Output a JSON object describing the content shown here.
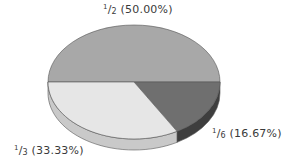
{
  "chart_data": {
    "type": "pie",
    "style": "3d",
    "title": "",
    "categories": [
      "1/2",
      "1/6",
      "1/3"
    ],
    "values": [
      50.0,
      16.67,
      33.33
    ],
    "labels": [
      "1/2 (50.00%)",
      "1/6 (16.67%)",
      "1/3 (33.33%)"
    ],
    "colors": [
      "#a8a8a8",
      "#6f6f6f",
      "#e6e6e6"
    ],
    "rim_colors": [
      "#8a8a8a",
      "#3e3e3e",
      "#c9c9c9"
    ],
    "legend": "none"
  },
  "labels": {
    "half": {
      "num": "1",
      "den": "2",
      "pct": "(50.00%)"
    },
    "sixth": {
      "num": "1",
      "den": "6",
      "pct": "(16.67%)"
    },
    "third": {
      "num": "1",
      "den": "3",
      "pct": "(33.33%)"
    }
  }
}
